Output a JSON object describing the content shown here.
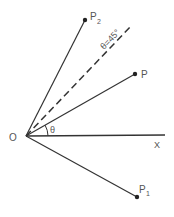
{
  "diagram": {
    "origin": {
      "label": "O",
      "x": 26,
      "y": 136
    },
    "axis": {
      "label": "X",
      "end": {
        "x": 165,
        "y": 135
      }
    },
    "points": [
      {
        "id": "P",
        "label": "P",
        "subscript": "",
        "x": 135,
        "y": 74
      },
      {
        "id": "P2",
        "label": "P",
        "subscript": "2",
        "x": 85,
        "y": 20
      },
      {
        "id": "P1",
        "label": "P",
        "subscript": "1",
        "x": 137,
        "y": 197
      }
    ],
    "dashed_line": {
      "label": "θ=45°",
      "end": {
        "x": 132,
        "y": 25
      }
    },
    "angle": {
      "label": "θ"
    },
    "colors": {
      "line": "#333333",
      "text": "#555555"
    }
  }
}
